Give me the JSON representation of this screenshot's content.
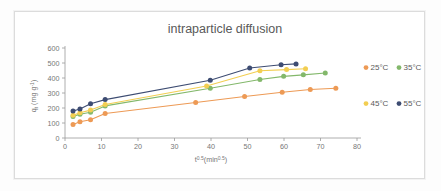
{
  "chart_data": {
    "type": "line",
    "title": "intraparticle diffusion",
    "xlabel": "t^0.5 (min^0.5)",
    "xlabel_base": "t",
    "xlabel_exp": "0.5",
    "xlabel_unit_base": "(min",
    "xlabel_unit_exp": "0.5",
    "xlabel_unit_close": ")",
    "ylabel": "qt (mg g-1)",
    "ylabel_base": "q",
    "ylabel_sub": "t",
    "ylabel_unit": " (mg g",
    "ylabel_unit_exp": "-1",
    "ylabel_unit_close": ")",
    "xlim": [
      0,
      80
    ],
    "ylim": [
      0,
      600
    ],
    "xticks": [
      0,
      10,
      20,
      30,
      40,
      50,
      60,
      70,
      80
    ],
    "yticks": [
      0,
      100,
      200,
      300,
      400,
      500,
      600
    ],
    "grid": false,
    "legend_position": "right",
    "series": [
      {
        "name": "25°C",
        "color": "#ED9A55",
        "x": [
          2.2,
          4.1,
          7.0,
          11.0,
          35.8,
          49.2,
          59.5,
          67.2,
          74.2
        ],
        "y": [
          90,
          108,
          122,
          163,
          237,
          277,
          305,
          323,
          332
        ]
      },
      {
        "name": "35°C",
        "color": "#83B86B",
        "x": [
          2.2,
          4.1,
          7.0,
          11.0,
          39.8,
          53.4,
          59.9,
          65.3,
          71.3
        ],
        "y": [
          143,
          158,
          172,
          214,
          332,
          390,
          411,
          421,
          433
        ]
      },
      {
        "name": "45°C",
        "color": "#F2CE52",
        "x": [
          2.2,
          4.1,
          7.0,
          11.0,
          38.8,
          53.4,
          60.7,
          65.9
        ],
        "y": [
          152,
          168,
          186,
          223,
          347,
          448,
          456,
          462
        ]
      },
      {
        "name": "55°C",
        "color": "#3D4C72",
        "x": [
          2.2,
          4.1,
          7.0,
          11.0,
          39.8,
          50.6,
          59.2,
          63.3
        ],
        "y": [
          180,
          193,
          228,
          256,
          385,
          467,
          488,
          494
        ]
      }
    ],
    "legend": [
      {
        "label": "25°C",
        "color": "#ED9A55"
      },
      {
        "label": "35°C",
        "color": "#83B86B"
      },
      {
        "label": "45°C",
        "color": "#F2CE52"
      },
      {
        "label": "55°C",
        "color": "#3D4C72"
      }
    ]
  }
}
